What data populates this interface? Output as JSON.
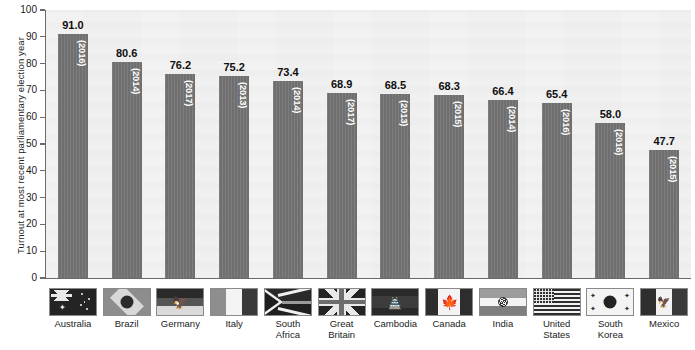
{
  "chart_data": {
    "type": "bar",
    "title": "",
    "xlabel": "",
    "ylabel": "Turnout at most recent parliamentary election year",
    "ylim": [
      0,
      100
    ],
    "ytick_step": 10,
    "yticks": [
      "100",
      "90",
      "80",
      "70",
      "60",
      "50",
      "40",
      "30",
      "20",
      "10",
      "0"
    ],
    "grid": false,
    "legend": "none",
    "categories": [
      "Australia",
      "Brazil",
      "Germany",
      "Italy",
      "South Africa",
      "Great Britain",
      "Cambodia",
      "Canada",
      "India",
      "United States",
      "South Korea",
      "Mexico"
    ],
    "values": [
      91.0,
      80.6,
      76.2,
      75.2,
      73.4,
      68.9,
      68.5,
      68.3,
      66.4,
      65.4,
      58.0,
      47.7
    ],
    "value_labels": [
      "91.0",
      "80.6",
      "76.2",
      "75.2",
      "73.4",
      "68.9",
      "68.5",
      "68.3",
      "66.4",
      "65.4",
      "58.0",
      "47.7"
    ],
    "years": [
      "(2016)",
      "(2014)",
      "(2017)",
      "(2013)",
      "(2014)",
      "(2017)",
      "(2013)",
      "(2015)",
      "(2014)",
      "(2016)",
      "(2016)",
      "(2015)"
    ],
    "bar_color": "#6f6f6f",
    "plot_background": "#f2f2f2",
    "axis_color": "#6a6a6a",
    "text_color": "#1b1b1b",
    "value_label_color": "#0f0f0f",
    "year_label_color": "#ffffff"
  },
  "bars": [
    {
      "country": "Australia",
      "country_line1": "Australia",
      "country_line2": "",
      "value": "91.0",
      "year": "(2016)",
      "flag": "flag-australia"
    },
    {
      "country": "Brazil",
      "country_line1": "Brazil",
      "country_line2": "",
      "value": "80.6",
      "year": "(2014)",
      "flag": "flag-brazil"
    },
    {
      "country": "Germany",
      "country_line1": "Germany",
      "country_line2": "",
      "value": "76.2",
      "year": "(2017)",
      "flag": "flag-germany"
    },
    {
      "country": "Italy",
      "country_line1": "Italy",
      "country_line2": "",
      "value": "75.2",
      "year": "(2013)",
      "flag": "flag-italy"
    },
    {
      "country": "South Africa",
      "country_line1": "South",
      "country_line2": "Africa",
      "value": "73.4",
      "year": "(2014)",
      "flag": "flag-south-africa"
    },
    {
      "country": "Great Britain",
      "country_line1": "Great",
      "country_line2": "Britain",
      "value": "68.9",
      "year": "(2017)",
      "flag": "flag-great-britain"
    },
    {
      "country": "Cambodia",
      "country_line1": "Cambodia",
      "country_line2": "",
      "value": "68.5",
      "year": "(2013)",
      "flag": "flag-cambodia"
    },
    {
      "country": "Canada",
      "country_line1": "Canada",
      "country_line2": "",
      "value": "68.3",
      "year": "(2015)",
      "flag": "flag-canada"
    },
    {
      "country": "India",
      "country_line1": "India",
      "country_line2": "",
      "value": "66.4",
      "year": "(2014)",
      "flag": "flag-india"
    },
    {
      "country": "United States",
      "country_line1": "United",
      "country_line2": "States",
      "value": "65.4",
      "year": "(2016)",
      "flag": "flag-united-states"
    },
    {
      "country": "South Korea",
      "country_line1": "South",
      "country_line2": "Korea",
      "value": "58.0",
      "year": "(2016)",
      "flag": "flag-south-korea"
    },
    {
      "country": "Mexico",
      "country_line1": "Mexico",
      "country_line2": "",
      "value": "47.7",
      "year": "(2015)",
      "flag": "flag-mexico"
    }
  ]
}
